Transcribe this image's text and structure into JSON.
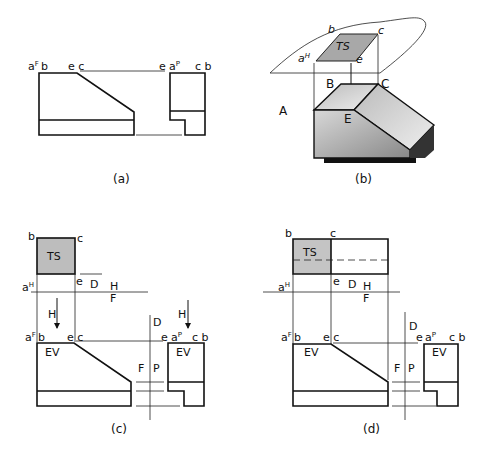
{
  "panels": {
    "a": {
      "caption": "(a)",
      "labels": {
        "aF": "a",
        "aF_sup": "F",
        "b": "b",
        "ec": "e c",
        "e": "e",
        "aP": "a",
        "aP_sup": "P",
        "cb": "c b"
      }
    },
    "b": {
      "caption": "(b)",
      "labels": {
        "b": "b",
        "c": "c",
        "aH": "a",
        "aH_sup": "H",
        "e": "e",
        "TS": "TS",
        "H": "H",
        "A": "A",
        "B": "B",
        "C": "C",
        "E": "E"
      }
    },
    "c": {
      "caption": "(c)",
      "labels": {
        "b": "b",
        "c": "c",
        "TS": "TS",
        "aH": "a",
        "aH_sup": "H",
        "e": "e",
        "D": "D",
        "H_fold": "H",
        "F_fold": "F",
        "H_arrow": "H",
        "aF": "a",
        "aF_sup": "F",
        "bF": "b",
        "ecF": "e c",
        "EV": "EV",
        "D2": "D",
        "F": "F",
        "P": "P",
        "H_arrow2": "H",
        "eP": "e",
        "aP": "a",
        "aP_sup": "P",
        "cbP": "c b",
        "EV2": "EV"
      }
    },
    "d": {
      "caption": "(d)",
      "labels": {
        "b": "b",
        "c": "c",
        "TS": "TS",
        "aH": "a",
        "aH_sup": "H",
        "e": "e",
        "D": "D",
        "H_fold": "H",
        "F_fold": "F",
        "aF": "a",
        "aF_sup": "F",
        "bF": "b",
        "ecF": "e c",
        "EV": "EV",
        "D2": "D",
        "F": "F",
        "P": "P",
        "eP": "e",
        "aP": "a",
        "aP_sup": "P",
        "cbP": "c b",
        "EV2": "EV"
      }
    }
  }
}
